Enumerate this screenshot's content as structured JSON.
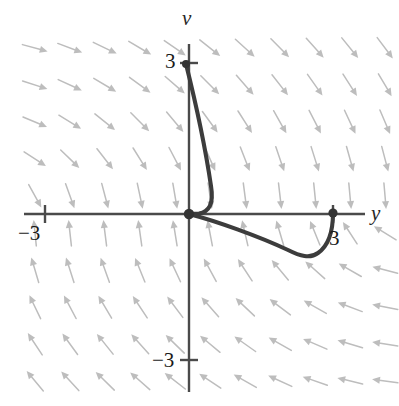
{
  "figure": {
    "type": "direction-field-phase-plot",
    "title": "",
    "axes": {
      "horizontal_label": "y",
      "vertical_label": "v",
      "origin_px": [
        189,
        214
      ],
      "x_range_units": [
        -4.4,
        4.2
      ],
      "y_range_units": [
        -3.4,
        3.0
      ],
      "unit_px_x": 48,
      "unit_px_y": 50,
      "horizontal_axis_px": {
        "x1": 24,
        "x2": 365,
        "y": 214
      },
      "vertical_axis_px": {
        "y1": 44,
        "y2": 392,
        "x": 189
      }
    },
    "tick_labels": {
      "v_positive": "3",
      "v_negative": "−3",
      "y_negative": "−3",
      "y_positive": "3"
    },
    "ticks_px": [
      {
        "name": "v-tick-3",
        "x": 189,
        "y": 63,
        "orientation": "horizontal",
        "len": 18
      },
      {
        "name": "v-tick-neg3",
        "x": 189,
        "y": 360,
        "orientation": "horizontal",
        "len": 18
      },
      {
        "name": "y-tick-neg3",
        "x": 45,
        "y": 214,
        "orientation": "vertical",
        "len": 18
      },
      {
        "name": "y-tick-3",
        "x": 333,
        "y": 214,
        "orientation": "vertical",
        "len": 18
      }
    ],
    "colors": {
      "background": "#ffffff",
      "axis": "#4a4a4a",
      "arrow": "#bdbdbd",
      "arrow_dark": "#9a9a9a",
      "trajectory": "#3c3c3c",
      "point": "#333333",
      "text": "#1a1a1a"
    },
    "points": [
      {
        "name": "origin-point",
        "x_px": 189,
        "y_px": 214,
        "r": 5.2,
        "label": ""
      },
      {
        "name": "right-endpoint",
        "x_px": 333,
        "y_px": 213,
        "r": 4.6,
        "label": "3"
      },
      {
        "name": "top-start-point",
        "x_px": 186,
        "y_px": 64,
        "r": 4.0,
        "label": "3"
      }
    ],
    "trajectory": {
      "name": "solution-curve",
      "stroke_width": 4.1,
      "branches": [
        {
          "name": "upper-branch",
          "d": "M 186 64 C 196 104, 206 152, 211 186 C 214 204, 209 212, 199 213.5 C 195 214, 192 214, 189 214"
        },
        {
          "name": "lower-branch",
          "d": "M 189 214 C 216 221, 258 236, 288 250 C 300 256, 310 259, 318 253 C 328 246, 333 232, 333 213"
        }
      ]
    },
    "field": {
      "name": "direction-field",
      "description": "arrows of a slope field, light gray",
      "grid_origin_px": [
        35,
        48
      ],
      "spacing_px": [
        35,
        37
      ],
      "cols": 11,
      "rows": 10,
      "arrow_len": 26
    },
    "chart_data": {
      "type": "scatter",
      "title": "",
      "xlabel": "y",
      "ylabel": "v",
      "xlim": [
        -4.4,
        4.2
      ],
      "ylim": [
        -3.4,
        3.0
      ],
      "xticks": [
        -3,
        3
      ],
      "yticks": [
        -3,
        3
      ],
      "xticklabels": [
        "−3",
        "3"
      ],
      "yticklabels": [
        "−3",
        "3"
      ],
      "grid": false,
      "legend": null,
      "annotations": [
        {
          "text": "v",
          "role": "vertical-axis-name"
        },
        {
          "text": "y",
          "role": "horizontal-axis-name"
        }
      ],
      "series": [
        {
          "name": "solution trajectory (upper branch)",
          "kind": "line",
          "x": [
            -0.06,
            0.0,
            0.17,
            0.34,
            0.44,
            0.46,
            0.41,
            0.21,
            0.0
          ],
          "y": [
            3.0,
            2.7,
            1.85,
            1.05,
            0.55,
            0.25,
            0.05,
            -0.01,
            0.0
          ]
        },
        {
          "name": "solution trajectory (lower branch)",
          "kind": "line",
          "x": [
            0.0,
            0.56,
            1.15,
            1.73,
            2.06,
            2.48,
            2.69,
            2.87,
            3.0,
            3.0
          ],
          "y": [
            0.0,
            -0.17,
            -0.33,
            -0.55,
            -0.67,
            -0.8,
            -0.82,
            -0.72,
            -0.4,
            0.02
          ]
        },
        {
          "name": "marked points",
          "kind": "scatter",
          "x": [
            0.0,
            3.0,
            -0.06
          ],
          "y": [
            0.0,
            0.02,
            3.0
          ]
        }
      ],
      "vector_field": {
        "description": "direction field arrows: point downward for v>0, upward for v<0, tilting toward -y in the right half and +y in the left half",
        "x_grid": [
          -3.2,
          -2.5,
          -1.8,
          -1.1,
          -0.4,
          0.3,
          1.0,
          1.8,
          2.5,
          3.2,
          3.8
        ],
        "y_grid": [
          3.3,
          2.5,
          1.8,
          1.1,
          0.3,
          -0.4,
          -1.1,
          -1.9,
          -2.6,
          -3.3
        ]
      }
    }
  }
}
